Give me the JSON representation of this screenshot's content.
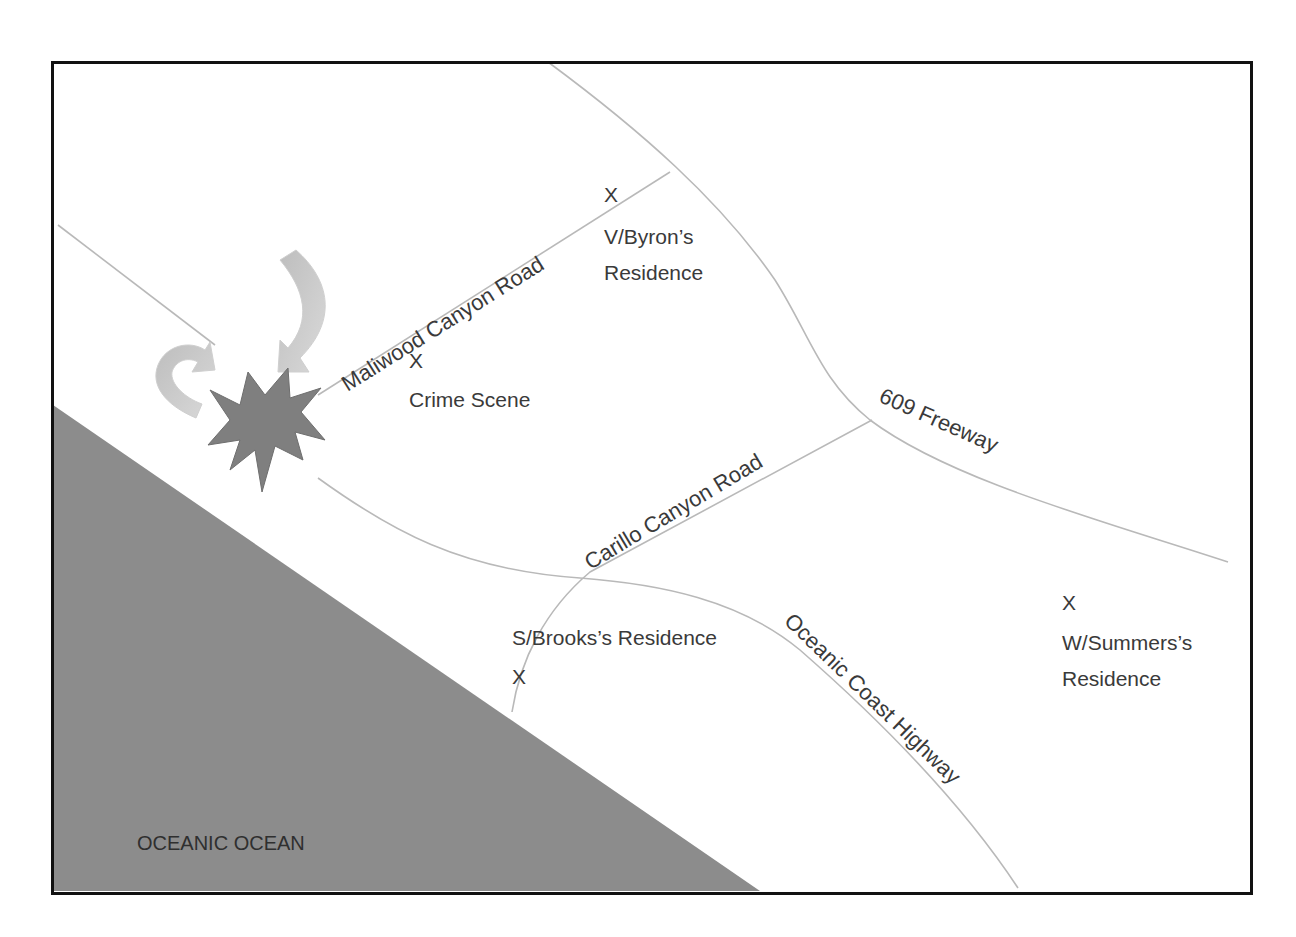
{
  "map": {
    "colors": {
      "background": "#ffffff",
      "ocean": "#8c8c8c",
      "road": "#b9b9b9",
      "frame": "#111111",
      "explosion": "#7f7f7f",
      "arrow": "#c8c8c8",
      "text": "#3a3a3a"
    },
    "water": {
      "label": "OCEANIC OCEAN"
    },
    "roads": [
      {
        "id": "maliwood",
        "label": "Maliwood Canyon Road"
      },
      {
        "id": "freeway",
        "label": "609 Freeway"
      },
      {
        "id": "carillo",
        "label": "Carillo Canyon Road"
      },
      {
        "id": "coast-highway",
        "label": "Oceanic Coast Highway"
      }
    ],
    "places": [
      {
        "id": "byron",
        "marker": "X",
        "line1": "V/Byron’s",
        "line2": "Residence"
      },
      {
        "id": "crime-scene",
        "marker": "X",
        "line1": "Crime Scene"
      },
      {
        "id": "brooks",
        "marker": "X",
        "line1": "S/Brooks’s Residence"
      },
      {
        "id": "summers",
        "marker": "X",
        "line1": "W/Summers’s",
        "line2": "Residence"
      }
    ],
    "symbols": [
      {
        "id": "explosion",
        "icon": "explosion-icon"
      },
      {
        "id": "arrow-down",
        "icon": "curved-arrow-down-icon"
      },
      {
        "id": "arrow-uturn",
        "icon": "u-turn-arrow-icon"
      }
    ]
  }
}
